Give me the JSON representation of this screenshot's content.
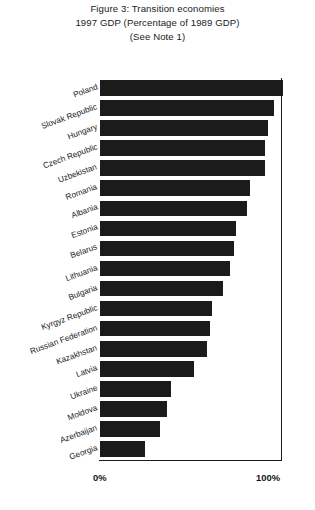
{
  "title": {
    "line1": "Figure 3: Transition economies",
    "line2": "1997 GDP (Percentage of 1989 GDP)",
    "line3": "(See Note 1)"
  },
  "axis": {
    "tick_zero": "0%",
    "tick_hundred": "100%"
  },
  "colors": {
    "bar": "#1b1b1b",
    "axis": "#1a1a1a",
    "background": "#ffffff",
    "text": "#1a1a1a"
  },
  "chart_data": {
    "type": "bar",
    "orientation": "horizontal",
    "title": "Figure 3: Transition economies 1997 GDP (Percentage of 1989 GDP) (See Note 1)",
    "xlabel": "",
    "ylabel": "",
    "xlim": [
      0,
      110
    ],
    "grid": false,
    "legend": false,
    "reference_line": 100,
    "tick_labels": [
      "0%",
      "100%"
    ],
    "categories": [
      "Poland",
      "Slovak Republic",
      "Hungary",
      "Czech Republic",
      "Uzbekistan",
      "Romania",
      "Albania",
      "Estonia",
      "Belarus",
      "Lithuania",
      "Bulgaria",
      "Kyrgyz Republic",
      "Russian Federation",
      "Kazakhstan",
      "Latvia",
      "Ukraine",
      "Moldova",
      "Azerbaijan",
      "Georgia"
    ],
    "values": [
      101,
      96,
      93,
      91,
      91,
      83,
      81,
      75,
      74,
      72,
      68,
      62,
      61,
      59,
      52,
      39,
      37,
      33,
      25
    ]
  }
}
